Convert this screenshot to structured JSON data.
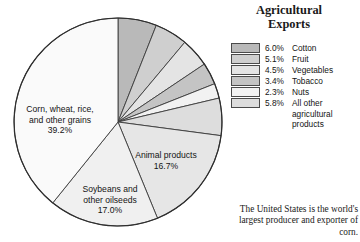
{
  "legend": {
    "title_line1": "Agricultural",
    "title_line2": "Exports",
    "items": [
      {
        "pct": "6.0%",
        "name": "Cotton",
        "color": "#b9b9b9"
      },
      {
        "pct": "5.1%",
        "name": "Fruit",
        "color": "#cfcfcf"
      },
      {
        "pct": "4.5%",
        "name": "Vegetables",
        "color": "#e4e4e4"
      },
      {
        "pct": "3.4%",
        "name": "Tobacco",
        "color": "#c4c4c4"
      },
      {
        "pct": "2.3%",
        "name": "Nuts",
        "color": "#f2f2f2"
      },
      {
        "pct": "5.8%",
        "name": "All other",
        "color": "#dddddd",
        "cont1": "agricultural",
        "cont2": "products"
      }
    ]
  },
  "caption": {
    "line1": "The United States is the",
    "line2": "world's largest producer",
    "line3": "and exporter of corn."
  },
  "pie_labels": [
    {
      "l1": "Corn, wheat, rice,",
      "l2": "and other grains",
      "l3": "39.2%",
      "x": 60,
      "y": 112
    },
    {
      "l1": "Animal products",
      "l2": "16.7%",
      "l3": "",
      "x": 166,
      "y": 158
    },
    {
      "l1": "Soybeans and",
      "l2": "other oilseeds",
      "l3": "17.0%",
      "x": 110,
      "y": 192
    }
  ],
  "chart_data": {
    "type": "pie",
    "title": "Agricultural Exports",
    "caption": "The United States is the world's largest producer and exporter of corn.",
    "start_angle_deg": 0,
    "direction": "clockwise",
    "center": {
      "x": 118,
      "y": 122
    },
    "radius": 104,
    "legend_position": "right",
    "slices": [
      {
        "label": "Cotton",
        "value": 6.0,
        "color": "#b9b9b9",
        "in_legend": true,
        "on_pie": false
      },
      {
        "label": "Fruit",
        "value": 5.1,
        "color": "#cfcfcf",
        "in_legend": true,
        "on_pie": false
      },
      {
        "label": "Vegetables",
        "value": 4.5,
        "color": "#e4e4e4",
        "in_legend": true,
        "on_pie": false
      },
      {
        "label": "Tobacco",
        "value": 3.4,
        "color": "#c4c4c4",
        "in_legend": true,
        "on_pie": false
      },
      {
        "label": "Nuts",
        "value": 2.3,
        "color": "#f2f2f2",
        "in_legend": true,
        "on_pie": false
      },
      {
        "label": "All other agricultural products",
        "value": 5.8,
        "color": "#dddddd",
        "in_legend": true,
        "on_pie": false
      },
      {
        "label": "Animal products",
        "value": 16.7,
        "color": "#e6e6e6",
        "in_legend": false,
        "on_pie": true
      },
      {
        "label": "Soybeans and other oilseeds",
        "value": 17.0,
        "color": "#f0f0f0",
        "in_legend": false,
        "on_pie": true
      },
      {
        "label": "Corn, wheat, rice, and other grains",
        "value": 39.2,
        "color": "#fafafa",
        "in_legend": false,
        "on_pie": true
      }
    ],
    "units": "percent of total agricultural exports",
    "total": 100.0
  }
}
